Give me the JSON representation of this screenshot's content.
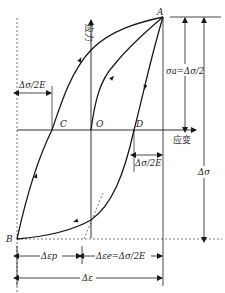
{
  "diagram": {
    "type": "stress-strain hysteresis loop",
    "axes": {
      "y_label": "应力",
      "x_label": "应变"
    },
    "points": {
      "A": "A",
      "B": "B",
      "C": "C",
      "O": "O",
      "D": "D"
    },
    "annotations": {
      "left_offset": "Δσ/2E",
      "right_offset": "Δσ/2E",
      "stress_amplitude": "σa=Δσ/2",
      "stress_range": "Δσ",
      "plastic_strain": "Δεp",
      "elastic_strain": "Δεe=Δσ/2E",
      "total_strain": "Δε"
    },
    "colors": {
      "line": "#1a1a1a",
      "dashed": "#555555",
      "background": "#ffffff"
    }
  }
}
